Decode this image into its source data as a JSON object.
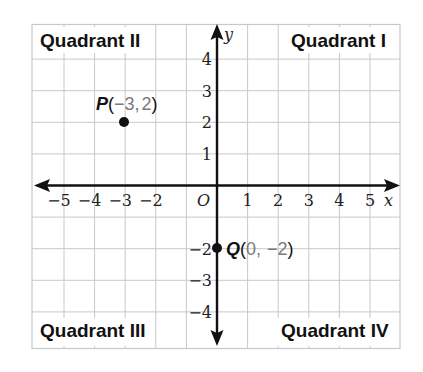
{
  "diagram": {
    "type": "coordinate-plane",
    "x_axis": {
      "name": "x",
      "range": [
        -6,
        6
      ],
      "tick_labels": [
        "-5",
        "-4",
        "-3",
        "-2",
        "1",
        "2",
        "3",
        "4",
        "5"
      ],
      "tick_values": [
        -5,
        -4,
        -3,
        -2,
        1,
        2,
        3,
        4,
        5
      ]
    },
    "y_axis": {
      "name": "y",
      "range": [
        -5,
        5
      ],
      "tick_labels": [
        "4",
        "3",
        "2",
        "1",
        "-2",
        "-3",
        "-4"
      ],
      "tick_values": [
        4,
        3,
        2,
        1,
        -2,
        -3,
        -4
      ]
    },
    "origin_label": "O",
    "quadrants": [
      {
        "id": "I",
        "label": "Quadrant I"
      },
      {
        "id": "II",
        "label": "Quadrant II"
      },
      {
        "id": "III",
        "label": "Quadrant III"
      },
      {
        "id": "IV",
        "label": "Quadrant IV"
      }
    ],
    "points": [
      {
        "name": "P",
        "x": -3,
        "y": 2,
        "x_text": "−3",
        "y_text": "2",
        "open": "(",
        "sep": ", ",
        "close": ")"
      },
      {
        "name": "Q",
        "x": 0,
        "y": -2,
        "x_text": "0",
        "y_text": "−2",
        "open": "(",
        "sep": ", ",
        "close": ")"
      }
    ],
    "colors": {
      "axis": "#111111",
      "grid": "#c8c8c8",
      "coordinate_text": "#7a7a7a",
      "point": "#111111"
    }
  }
}
